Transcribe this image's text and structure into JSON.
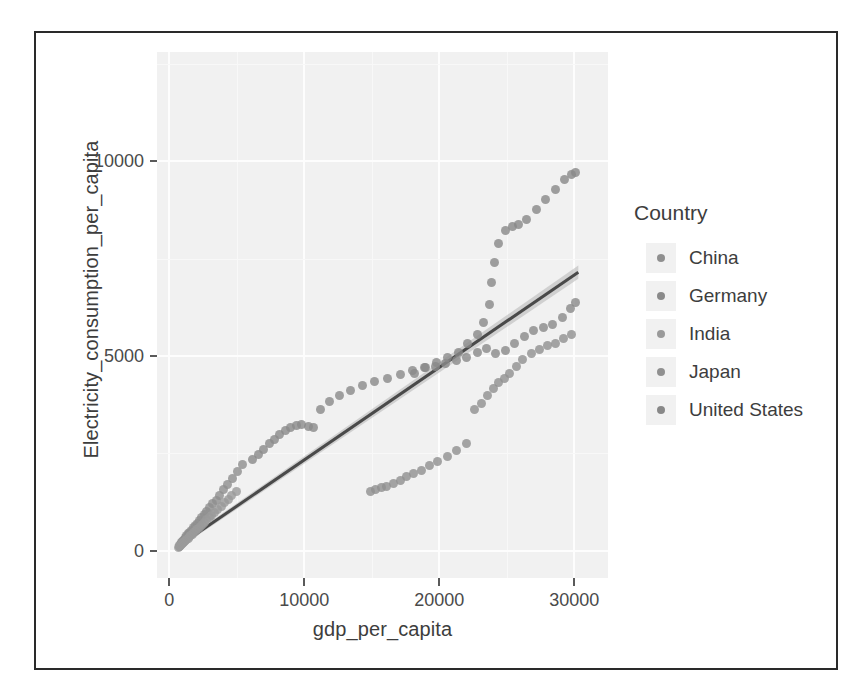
{
  "figure": {
    "frame_border_color": "#2a2a2a",
    "background_color": "#ffffff"
  },
  "legend": {
    "title": "Country",
    "position": "right",
    "items": [
      {
        "label": "China",
        "color": "#8f8f8f"
      },
      {
        "label": "Germany",
        "color": "#8a8a8a"
      },
      {
        "label": "India",
        "color": "#9a9a9a"
      },
      {
        "label": "Japan",
        "color": "#909090"
      },
      {
        "label": "United States",
        "color": "#888888"
      }
    ]
  },
  "chart_data": {
    "type": "scatter",
    "title": "",
    "xlabel": "gdp_per_capita",
    "ylabel": "Electricity_consumption_per_capita",
    "xlim": [
      -900,
      32500
    ],
    "ylim": [
      -700,
      12800
    ],
    "xticks": [
      0,
      10000,
      20000,
      30000
    ],
    "yticks": [
      0,
      5000,
      10000
    ],
    "xtick_labels": [
      "0",
      "10000",
      "20000",
      "30000"
    ],
    "ytick_labels": [
      "0",
      "5000",
      "10000"
    ],
    "grid": true,
    "grid_major_color": "#fdfdfd",
    "grid_minor_color": "#f8f8f8",
    "panel_background": "#f1f1f1",
    "point_color": "#8c8c8c",
    "point_size": 9,
    "trend": {
      "type": "linear-fit",
      "line_color": "#4a4a4a",
      "band_color": "#b4b4b4",
      "x_start": 700,
      "y_start": 120,
      "x_end": 30300,
      "y_end": 7150,
      "band_half_width": 170
    },
    "series": [
      {
        "name": "China",
        "points": [
          [
            780,
            120
          ],
          [
            820,
            150
          ],
          [
            880,
            175
          ],
          [
            930,
            200
          ],
          [
            990,
            230
          ],
          [
            1060,
            265
          ],
          [
            1140,
            300
          ],
          [
            1230,
            345
          ],
          [
            1320,
            385
          ],
          [
            1430,
            430
          ],
          [
            1540,
            480
          ],
          [
            1660,
            530
          ],
          [
            1790,
            590
          ],
          [
            1930,
            650
          ],
          [
            2080,
            710
          ],
          [
            2240,
            780
          ],
          [
            2410,
            850
          ],
          [
            2590,
            930
          ],
          [
            2790,
            1010
          ],
          [
            3000,
            1100
          ],
          [
            3230,
            1200
          ],
          [
            3480,
            1300
          ],
          [
            3750,
            1420
          ],
          [
            4040,
            1560
          ],
          [
            4350,
            1700
          ],
          [
            4690,
            1860
          ],
          [
            5050,
            2030
          ],
          [
            5450,
            2210
          ]
        ]
      },
      {
        "name": "India",
        "points": [
          [
            700,
            95
          ],
          [
            740,
            110
          ],
          [
            790,
            125
          ],
          [
            840,
            140
          ],
          [
            900,
            160
          ],
          [
            960,
            180
          ],
          [
            1020,
            200
          ],
          [
            1090,
            220
          ],
          [
            1160,
            245
          ],
          [
            1240,
            270
          ],
          [
            1320,
            295
          ],
          [
            1410,
            325
          ],
          [
            1500,
            355
          ],
          [
            1600,
            385
          ],
          [
            1700,
            420
          ],
          [
            1810,
            455
          ],
          [
            1930,
            495
          ],
          [
            2050,
            535
          ],
          [
            2180,
            580
          ],
          [
            2320,
            625
          ],
          [
            2470,
            675
          ],
          [
            2630,
            730
          ],
          [
            2800,
            790
          ],
          [
            2980,
            850
          ],
          [
            3170,
            915
          ],
          [
            3380,
            985
          ],
          [
            3600,
            1060
          ],
          [
            3840,
            1140
          ],
          [
            4090,
            1225
          ],
          [
            4360,
            1315
          ],
          [
            4650,
            1410
          ],
          [
            4960,
            1510
          ]
        ]
      },
      {
        "name": "Germany",
        "points": [
          [
            6200,
            2330
          ],
          [
            6600,
            2470
          ],
          [
            7000,
            2600
          ],
          [
            7400,
            2740
          ],
          [
            7800,
            2860
          ],
          [
            8200,
            2980
          ],
          [
            8600,
            3080
          ],
          [
            9000,
            3160
          ],
          [
            9400,
            3210
          ],
          [
            9800,
            3250
          ],
          [
            10300,
            3180
          ],
          [
            10700,
            3150
          ],
          [
            11200,
            3630
          ],
          [
            11900,
            3820
          ],
          [
            12600,
            3980
          ],
          [
            13400,
            4120
          ],
          [
            14300,
            4250
          ],
          [
            15200,
            4340
          ],
          [
            16200,
            4420
          ],
          [
            17100,
            4520
          ],
          [
            18000,
            4630
          ],
          [
            18900,
            4690
          ],
          [
            19700,
            4740
          ],
          [
            20500,
            4810
          ],
          [
            21300,
            4880
          ],
          [
            22000,
            4950
          ],
          [
            22800,
            5080
          ],
          [
            23500,
            5190
          ],
          [
            24200,
            5060
          ],
          [
            24900,
            5140
          ],
          [
            25600,
            5330
          ],
          [
            26300,
            5500
          ],
          [
            27000,
            5650
          ],
          [
            27700,
            5740
          ],
          [
            28400,
            5800
          ],
          [
            29100,
            5980
          ],
          [
            29700,
            6210
          ],
          [
            30100,
            6380
          ]
        ]
      },
      {
        "name": "Japan",
        "points": [
          [
            14900,
            1520
          ],
          [
            15300,
            1560
          ],
          [
            15700,
            1610
          ],
          [
            16100,
            1660
          ],
          [
            16600,
            1730
          ],
          [
            17100,
            1810
          ],
          [
            17600,
            1900
          ],
          [
            18100,
            1980
          ],
          [
            18700,
            2070
          ],
          [
            19300,
            2180
          ],
          [
            19900,
            2290
          ],
          [
            20600,
            2420
          ],
          [
            21300,
            2560
          ],
          [
            22000,
            2740
          ],
          [
            22600,
            3620
          ],
          [
            23100,
            3780
          ],
          [
            23600,
            3990
          ],
          [
            24000,
            4160
          ],
          [
            24400,
            4320
          ],
          [
            24800,
            4420
          ],
          [
            25200,
            4540
          ],
          [
            25700,
            4740
          ],
          [
            26200,
            4900
          ],
          [
            26800,
            5060
          ],
          [
            27400,
            5170
          ],
          [
            28000,
            5260
          ],
          [
            28600,
            5320
          ],
          [
            29200,
            5440
          ],
          [
            29800,
            5550
          ]
        ]
      },
      {
        "name": "United States",
        "points": [
          [
            18200,
            4540
          ],
          [
            19000,
            4690
          ],
          [
            19800,
            4830
          ],
          [
            20600,
            4960
          ],
          [
            21400,
            5100
          ],
          [
            22100,
            5320
          ],
          [
            22800,
            5550
          ],
          [
            23300,
            5870
          ],
          [
            23700,
            6320
          ],
          [
            23900,
            6880
          ],
          [
            24100,
            7410
          ],
          [
            24400,
            7880
          ],
          [
            24900,
            8230
          ],
          [
            25400,
            8320
          ],
          [
            25900,
            8380
          ],
          [
            26500,
            8510
          ],
          [
            27200,
            8760
          ],
          [
            27900,
            9010
          ],
          [
            28600,
            9280
          ],
          [
            29300,
            9520
          ],
          [
            29800,
            9650
          ],
          [
            30100,
            9700
          ]
        ]
      }
    ]
  }
}
